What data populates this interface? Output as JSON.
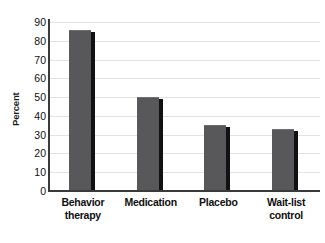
{
  "chart_data": {
    "type": "bar",
    "title": "",
    "xlabel": "",
    "ylabel": "Percent",
    "ylim": [
      0,
      90
    ],
    "ytick_step": 10,
    "grid": true,
    "legend": "none",
    "orientation": "vertical",
    "categories": [
      "Behavior therapy",
      "Medication",
      "Placebo",
      "Wait-list control"
    ],
    "category_lines": [
      [
        "Behavior",
        "therapy"
      ],
      [
        "Medication",
        ""
      ],
      [
        "Placebo",
        ""
      ],
      [
        "Wait-list",
        "control"
      ]
    ],
    "values": [
      86,
      50,
      35,
      33
    ],
    "yticks": [
      0,
      10,
      20,
      30,
      40,
      50,
      60,
      70,
      80,
      90
    ],
    "ytick_labels": [
      "0",
      "10",
      "20",
      "30",
      "40",
      "50",
      "60",
      "70",
      "80",
      "90"
    ],
    "colors": {
      "bar_face": "#58585a",
      "bar_shadow": "#111113",
      "gridline": "#e3e3e3",
      "axis": "#3a3a3a",
      "background": "#ffffff",
      "text": "#101010"
    }
  }
}
